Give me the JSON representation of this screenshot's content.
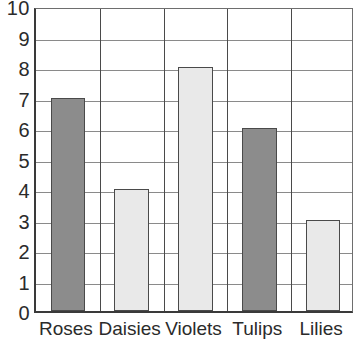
{
  "chart_data": {
    "type": "bar",
    "title": "",
    "xlabel": "",
    "ylabel": "",
    "categories": [
      "Roses",
      "Daisies",
      "Violets",
      "Tulips",
      "Lilies"
    ],
    "values": [
      7,
      4,
      8,
      6,
      3
    ],
    "ylim": [
      0,
      10
    ],
    "yticks": [
      "0",
      "1",
      "2",
      "3",
      "4",
      "5",
      "6",
      "7",
      "8",
      "9",
      "10"
    ],
    "grid": true,
    "legend": "none",
    "bar_colors": [
      "#8c8c8c",
      "#e9e9e9",
      "#e9e9e9",
      "#8c8c8c",
      "#e9e9e9"
    ],
    "bar_border_color": "#4a4a4a",
    "gridline_color": "#8a8a8a",
    "axis_color": "#3a3a3a",
    "text_color": "#2b2b2b"
  }
}
